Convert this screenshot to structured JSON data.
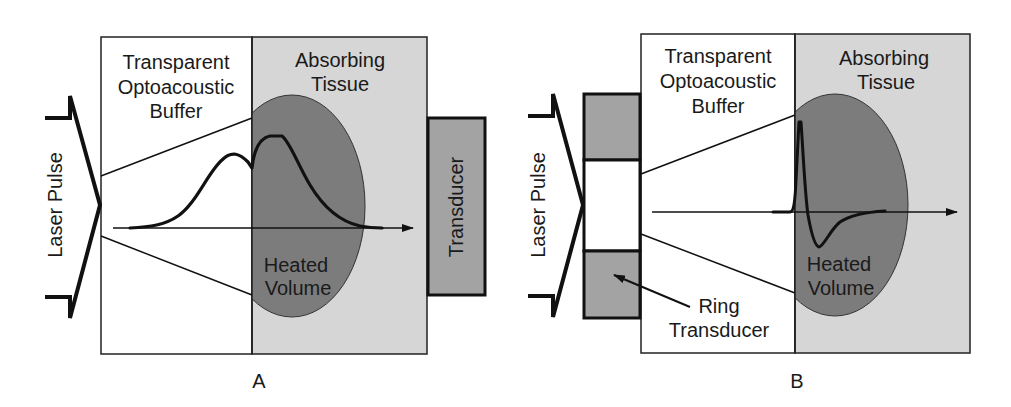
{
  "figure": {
    "panels": [
      {
        "id": "A",
        "caption": "A",
        "labels": {
          "laser_pulse": "Laser Pulse",
          "buffer_line1": "Transparent",
          "buffer_line2": "Optoacoustic",
          "buffer_line3": "Buffer",
          "tissue_line1": "Absorbing",
          "tissue_line2": "Tissue",
          "heated_line1": "Heated",
          "heated_line2": "Volume",
          "transducer": "Transducer"
        },
        "signal_shape": "broad double-hump pressure profile"
      },
      {
        "id": "B",
        "caption": "B",
        "labels": {
          "laser_pulse": "Laser Pulse",
          "buffer_line1": "Transparent",
          "buffer_line2": "Optoacoustic",
          "buffer_line3": "Buffer",
          "tissue_line1": "Absorbing",
          "tissue_line2": "Tissue",
          "heated_line1": "Heated",
          "heated_line2": "Volume",
          "ring_line1": "Ring",
          "ring_line2": "Transducer"
        },
        "signal_shape": "bipolar N-shaped pressure pulse"
      }
    ],
    "colors": {
      "background": "#ffffff",
      "buffer_fill": "#ffffff",
      "tissue_fill": "#d6d6d6",
      "heated_volume_fill": "#7c7c7c",
      "transducer_fill": "#a3a3a3",
      "stroke": "#111111"
    }
  }
}
